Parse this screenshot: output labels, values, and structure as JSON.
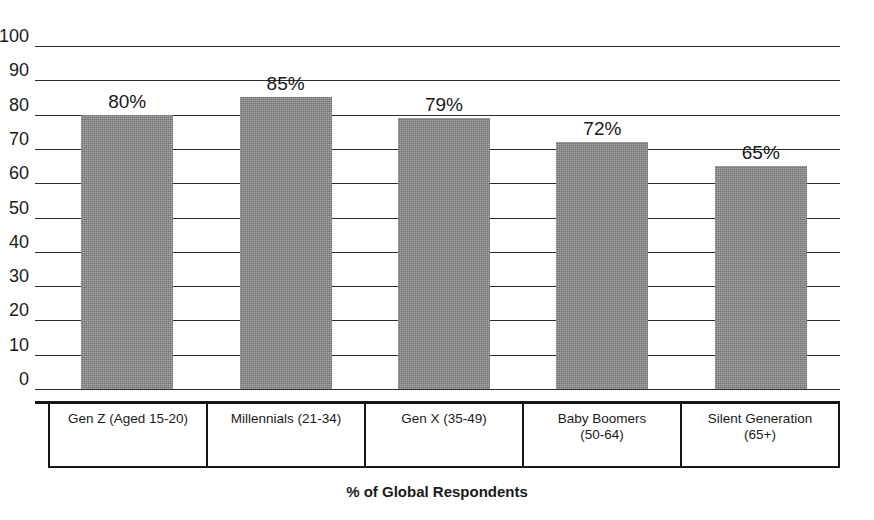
{
  "chart_data": {
    "type": "bar",
    "title": "",
    "subtitle": "",
    "xlabel": "% of Global Respondents",
    "ylabel": "",
    "ylim": [
      0,
      100
    ],
    "ytick_step": 10,
    "yticks": [
      "100",
      "90",
      "80",
      "70",
      "60",
      "50",
      "40",
      "30",
      "20",
      "10",
      "0"
    ],
    "grid": true,
    "legend": false,
    "legend_position": "none",
    "categories": [
      "Gen Z (Aged 15-20)",
      "Millennials (21-34)",
      "Gen X (35-49)",
      "Baby Boomers\n(50-64)",
      "Silent Generation\n(65+)"
    ],
    "values": [
      80,
      85,
      79,
      72,
      65
    ],
    "data_labels": [
      "80%",
      "85%",
      "79%",
      "72%",
      "65%"
    ],
    "bar_color": "#8c8c8c",
    "axis_color": "#161616",
    "text_color": "#1a1a1a",
    "background": "#ffffff"
  }
}
